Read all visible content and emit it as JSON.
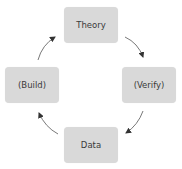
{
  "diagram": {
    "type": "cycle",
    "nodes": [
      {
        "id": "theory",
        "label": "Theory"
      },
      {
        "id": "verify",
        "label": "(Verify)"
      },
      {
        "id": "data",
        "label": "Data"
      },
      {
        "id": "build",
        "label": "(Build)"
      }
    ],
    "edges": [
      {
        "from": "theory",
        "to": "verify"
      },
      {
        "from": "verify",
        "to": "data"
      },
      {
        "from": "data",
        "to": "build"
      },
      {
        "from": "build",
        "to": "theory"
      }
    ],
    "colors": {
      "node_fill": "#d9d9d9",
      "node_text": "#3a3a3a",
      "arrow": "#333333"
    }
  }
}
